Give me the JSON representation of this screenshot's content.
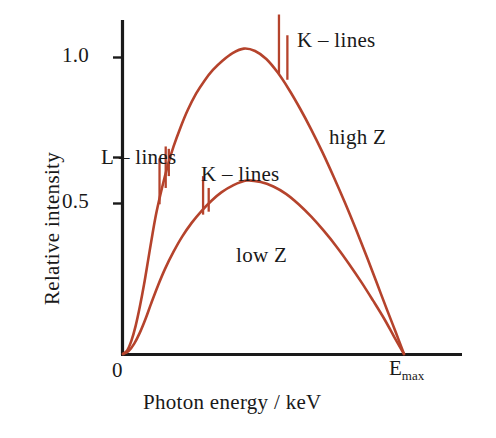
{
  "chart_data": {
    "type": "line",
    "title": "",
    "xlabel": "Photon energy / keV",
    "ylabel": "Relative intensity",
    "x_tick_labels": [
      "0",
      "E",
      "max"
    ],
    "x_origin_label": "0",
    "x_end_label_base": "E",
    "x_end_label_sub": "max",
    "y_tick_labels": [
      "1.0",
      "0.5"
    ],
    "y_tick_values": [
      1.0,
      0.5
    ],
    "xlim": [
      0,
      1.0
    ],
    "ylim": [
      0,
      1.15
    ],
    "grid": false,
    "legend_position": "inline-annotations",
    "curve_color": "#b5432c",
    "axis_color": "#1a1a1a",
    "series": [
      {
        "name": "high Z",
        "label": "high Z",
        "peak_x": 0.43,
        "peak_y": 1.03,
        "end_x": 1.0,
        "end_y": 0.0,
        "points": [
          [
            0.0,
            0.0
          ],
          [
            0.015,
            0.012
          ],
          [
            0.03,
            0.045
          ],
          [
            0.045,
            0.095
          ],
          [
            0.06,
            0.16
          ],
          [
            0.075,
            0.235
          ],
          [
            0.09,
            0.32
          ],
          [
            0.105,
            0.405
          ],
          [
            0.12,
            0.482
          ],
          [
            0.14,
            0.565
          ],
          [
            0.16,
            0.638
          ],
          [
            0.18,
            0.7
          ],
          [
            0.205,
            0.765
          ],
          [
            0.23,
            0.822
          ],
          [
            0.26,
            0.878
          ],
          [
            0.29,
            0.922
          ],
          [
            0.32,
            0.958
          ],
          [
            0.355,
            0.99
          ],
          [
            0.39,
            1.015
          ],
          [
            0.43,
            1.03
          ],
          [
            0.47,
            1.022
          ],
          [
            0.51,
            0.995
          ],
          [
            0.55,
            0.95
          ],
          [
            0.59,
            0.893
          ],
          [
            0.63,
            0.828
          ],
          [
            0.67,
            0.757
          ],
          [
            0.71,
            0.68
          ],
          [
            0.75,
            0.597
          ],
          [
            0.79,
            0.51
          ],
          [
            0.83,
            0.418
          ],
          [
            0.87,
            0.322
          ],
          [
            0.905,
            0.235
          ],
          [
            0.94,
            0.148
          ],
          [
            0.97,
            0.075
          ],
          [
            1.0,
            0.0
          ]
        ]
      },
      {
        "name": "low Z",
        "label": "low Z",
        "peak_x": 0.44,
        "peak_y": 0.585,
        "end_x": 1.0,
        "end_y": 0.0,
        "points": [
          [
            0.0,
            0.0
          ],
          [
            0.02,
            0.01
          ],
          [
            0.04,
            0.035
          ],
          [
            0.06,
            0.072
          ],
          [
            0.08,
            0.118
          ],
          [
            0.1,
            0.17
          ],
          [
            0.125,
            0.232
          ],
          [
            0.15,
            0.288
          ],
          [
            0.18,
            0.345
          ],
          [
            0.21,
            0.395
          ],
          [
            0.245,
            0.443
          ],
          [
            0.28,
            0.483
          ],
          [
            0.315,
            0.517
          ],
          [
            0.35,
            0.545
          ],
          [
            0.39,
            0.568
          ],
          [
            0.44,
            0.585
          ],
          [
            0.49,
            0.58
          ],
          [
            0.535,
            0.565
          ],
          [
            0.58,
            0.54
          ],
          [
            0.625,
            0.505
          ],
          [
            0.67,
            0.463
          ],
          [
            0.715,
            0.415
          ],
          [
            0.76,
            0.362
          ],
          [
            0.805,
            0.303
          ],
          [
            0.85,
            0.24
          ],
          [
            0.89,
            0.18
          ],
          [
            0.93,
            0.118
          ],
          [
            0.965,
            0.058
          ],
          [
            1.0,
            0.0
          ]
        ]
      }
    ],
    "annotations": [
      {
        "id": "k-lines-high-z",
        "text": "K – lines",
        "target_series": "high Z",
        "spikes": [
          {
            "x": 0.555,
            "top_y": 1.145,
            "base_y": 0.945
          },
          {
            "x": 0.585,
            "top_y": 1.075,
            "base_y": 0.925
          }
        ]
      },
      {
        "id": "l-lines-high-z",
        "text": "L – lines",
        "target_series": "high Z",
        "spikes": [
          {
            "x": 0.13,
            "top_y": 0.66,
            "base_y": 0.505
          },
          {
            "x": 0.152,
            "top_y": 0.7,
            "base_y": 0.56
          },
          {
            "x": 0.163,
            "top_y": 0.692,
            "base_y": 0.6
          }
        ]
      },
      {
        "id": "k-lines-low-z",
        "text": "K – lines",
        "target_series": "low Z",
        "spikes": [
          {
            "x": 0.285,
            "top_y": 0.6,
            "base_y": 0.47
          },
          {
            "x": 0.305,
            "top_y": 0.56,
            "base_y": 0.48
          }
        ]
      },
      {
        "id": "high-z-label",
        "text": "high Z",
        "target_series": "high Z"
      },
      {
        "id": "low-z-label",
        "text": "low Z",
        "target_series": "low Z"
      }
    ]
  },
  "labels": {
    "y_tick_1": "1.0",
    "y_tick_05": "0.5",
    "x_origin": "0",
    "x_emax_base": "E",
    "x_emax_sub": "max",
    "x_axis_title": "Photon energy / keV",
    "y_axis_title": "Relative intensity",
    "k_lines_high": "K – lines",
    "l_lines_high": "L – lines",
    "k_lines_low": "K – lines",
    "high_z": "high Z",
    "low_z": "low Z"
  },
  "colors": {
    "curve": "#b5432c",
    "axis": "#1a1a1a",
    "text": "#191919",
    "background": "#ffffff"
  }
}
